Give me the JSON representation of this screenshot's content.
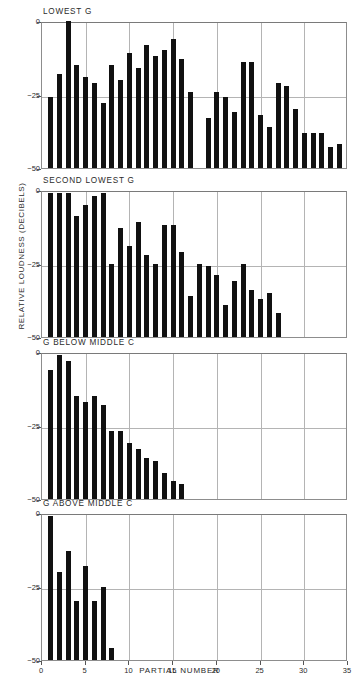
{
  "figure": {
    "ylabel": "RELATIVE LOUDNESS (DECIBELS)",
    "xlabel": "PARTIAL NUMBER",
    "bar_color": "#111111",
    "grid_color": "#b4b4b4",
    "frame_color": "#8d8d8d"
  },
  "axes": {
    "y_ticks": [
      "0",
      "−25",
      "−50"
    ],
    "x_ticks": [
      "0",
      "5",
      "10",
      "15",
      "20",
      "25",
      "30",
      "35"
    ]
  },
  "chart_data": [
    {
      "type": "bar",
      "title": "LOWEST G",
      "xlabel": "PARTIAL NUMBER",
      "ylabel": "RELATIVE LOUDNESS (DECIBELS)",
      "xlim": [
        0,
        35
      ],
      "ylim": [
        -50,
        0
      ],
      "grid": true,
      "x": [
        1,
        2,
        3,
        4,
        5,
        6,
        7,
        8,
        9,
        10,
        11,
        12,
        13,
        14,
        15,
        16,
        17,
        19,
        20,
        21,
        22,
        23,
        24,
        25,
        26,
        27,
        28,
        29,
        30,
        31,
        32,
        33,
        34
      ],
      "values": [
        -26,
        -18,
        0,
        -15,
        -19,
        -21,
        -28,
        -15,
        -20,
        -11,
        -16,
        -8,
        -12,
        -10,
        -6,
        -13,
        -24,
        -33,
        -24,
        -26,
        -31,
        -14,
        -14,
        -32,
        -36,
        -21,
        -22,
        -30,
        -38,
        -38,
        -38,
        -43,
        -42,
        -44
      ],
      "categories": [
        "1",
        "2",
        "3",
        "4",
        "5",
        "6",
        "7",
        "8",
        "9",
        "10",
        "11",
        "12",
        "13",
        "14",
        "15",
        "16",
        "17",
        "19",
        "20",
        "21",
        "22",
        "23",
        "24",
        "25",
        "26",
        "27",
        "28",
        "29",
        "30",
        "31",
        "32",
        "33",
        "34"
      ],
      "note": "partial 18 absent"
    },
    {
      "type": "bar",
      "title": "SECOND LOWEST G",
      "xlabel": "PARTIAL NUMBER",
      "ylabel": "RELATIVE LOUDNESS (DECIBELS)",
      "xlim": [
        0,
        35
      ],
      "ylim": [
        -50,
        0
      ],
      "grid": true,
      "x": [
        1,
        2,
        3,
        4,
        5,
        6,
        7,
        8,
        9,
        10,
        11,
        12,
        13,
        14,
        15,
        16,
        17,
        18,
        19,
        20,
        21,
        22,
        23,
        24,
        25,
        26,
        27
      ],
      "values": [
        -1,
        -1,
        -1,
        -9,
        -5,
        -2,
        -1,
        -25,
        -13,
        -19,
        -11,
        -22,
        -25,
        -12,
        -12,
        -21,
        -36,
        -25,
        -26,
        -29,
        -39,
        -31,
        -25,
        -34,
        -37,
        -35,
        -42
      ],
      "categories": [
        "1",
        "2",
        "3",
        "4",
        "5",
        "6",
        "7",
        "8",
        "9",
        "10",
        "11",
        "12",
        "13",
        "14",
        "15",
        "16",
        "17",
        "18",
        "19",
        "20",
        "21",
        "22",
        "23",
        "24",
        "25",
        "26",
        "27"
      ]
    },
    {
      "type": "bar",
      "title": "G BELOW MIDDLE C",
      "xlabel": "PARTIAL NUMBER",
      "ylabel": "RELATIVE LOUDNESS (DECIBELS)",
      "xlim": [
        0,
        35
      ],
      "ylim": [
        -50,
        0
      ],
      "grid": true,
      "x": [
        1,
        2,
        3,
        4,
        5,
        6,
        7,
        8,
        9,
        10,
        11,
        12,
        13,
        14,
        15,
        16
      ],
      "values": [
        -6,
        -1,
        -3,
        -15,
        -17,
        -15,
        -18,
        -27,
        -27,
        -31,
        -33,
        -36,
        -37,
        -41,
        -44,
        -45
      ],
      "categories": [
        "1",
        "2",
        "3",
        "4",
        "5",
        "6",
        "7",
        "8",
        "9",
        "10",
        "11",
        "12",
        "13",
        "14",
        "15",
        "16"
      ]
    },
    {
      "type": "bar",
      "title": "G ABOVE MIDDLE C",
      "xlabel": "PARTIAL NUMBER",
      "ylabel": "RELATIVE LOUDNESS (DECIBELS)",
      "xlim": [
        0,
        35
      ],
      "ylim": [
        -50,
        0
      ],
      "grid": true,
      "x": [
        1,
        2,
        3,
        4,
        5,
        6,
        7,
        8
      ],
      "values": [
        -1,
        -20,
        -13,
        -30,
        -18,
        -30,
        -25,
        -46
      ],
      "categories": [
        "1",
        "2",
        "3",
        "4",
        "5",
        "6",
        "7",
        "8"
      ]
    }
  ]
}
